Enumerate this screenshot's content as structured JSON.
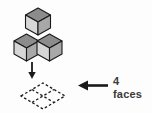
{
  "figure": {
    "background_color": "#fdfdfd",
    "outline_color": "#1a1a1a"
  },
  "solid": {
    "name": "three-cube-stack",
    "cube_count": 3,
    "arrangement": "one cube on top of the back corner, two cubes in the front row",
    "face_colors": {
      "top": "#8c8c8c",
      "left": "#d6d6d6",
      "right": "#a8a8a8"
    },
    "cubes": [
      {
        "label": "top-cube",
        "position": "upper"
      },
      {
        "label": "front-left-cube",
        "position": "lower-left"
      },
      {
        "label": "front-right-cube",
        "position": "lower-right"
      }
    ]
  },
  "projection_arrow": {
    "name": "down-arrow",
    "direction": "down",
    "color": "#1a1a1a"
  },
  "footprint": {
    "name": "dashed-base-grid",
    "shape": "rhombus",
    "rows": 2,
    "columns": 2,
    "cell_count": 4,
    "stroke_style": "dashed",
    "stroke_color": "#1a1a1a"
  },
  "callout_arrow": {
    "name": "left-arrow",
    "direction": "left",
    "color": "#1a1a1a"
  },
  "callout": {
    "count": "4",
    "unit": "faces",
    "text_color": "#3a3a3a"
  }
}
